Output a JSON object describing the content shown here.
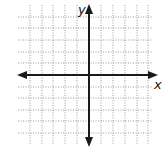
{
  "diagram": {
    "type": "coordinate-plane",
    "x_axis_label": "x",
    "y_axis_label": "y",
    "grid": {
      "columns": 12,
      "rows": 12,
      "line_style": "dotted",
      "line_color": "#9a9a9a"
    },
    "axis_color": "#1a1a1a",
    "background": "#ffffff"
  }
}
